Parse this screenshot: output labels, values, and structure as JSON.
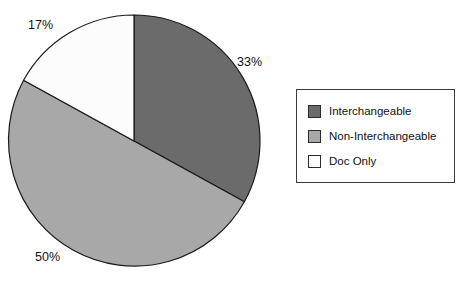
{
  "chart_data": {
    "type": "pie",
    "title": "",
    "categories": [
      "Interchangeable",
      "Non-Interchangeable",
      "Doc Only"
    ],
    "values": [
      33,
      50,
      17
    ],
    "value_labels": [
      "33%",
      "50%",
      "17%"
    ],
    "units": "percent",
    "start_angle_deg": 0,
    "direction": "clockwise",
    "legend_position": "right",
    "grid": false,
    "colors": [
      "#6b6b6b",
      "#a8a8a8",
      "#fcfcfc"
    ],
    "slice_border_color": "#1a1a1a",
    "background": "#ffffff",
    "geometry": {
      "center_x": 134,
      "center_y": 141,
      "radius": 126
    },
    "slices": [
      {
        "label": "Interchangeable",
        "value": 33,
        "display": "33%",
        "color": "#6b6b6b",
        "start_deg": 0,
        "end_deg": 118.8
      },
      {
        "label": "Non-Interchangeable",
        "value": 50,
        "display": "50%",
        "color": "#a8a8a8",
        "start_deg": 118.8,
        "end_deg": 298.8
      },
      {
        "label": "Doc Only",
        "value": 17,
        "display": "17%",
        "color": "#fcfcfc",
        "start_deg": 298.8,
        "end_deg": 360
      }
    ]
  },
  "labels": {
    "pct_interchangeable": "33%",
    "pct_non_interchangeable": "50%",
    "pct_doc_only": "17%"
  },
  "legend": {
    "items": [
      {
        "label": "Interchangeable",
        "color": "#6b6b6b"
      },
      {
        "label": "Non-Interchangeable",
        "color": "#a8a8a8"
      },
      {
        "label": "Doc Only",
        "color": "#fcfcfc"
      }
    ]
  }
}
